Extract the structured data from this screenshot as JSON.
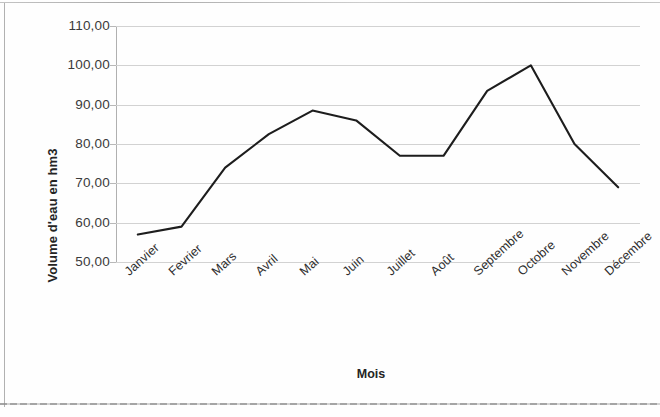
{
  "chart_data": {
    "type": "line",
    "title": "",
    "xlabel": "Mois",
    "ylabel": "Volume d'eau en hm3",
    "categories": [
      "Janvier",
      "Fevrier",
      "Mars",
      "Avril",
      "Mai",
      "Juin",
      "Juillet",
      "Août",
      "Septembre",
      "Octobre",
      "Novembre",
      "Décembre"
    ],
    "values": [
      57.0,
      59.0,
      74.0,
      82.5,
      88.5,
      86.0,
      77.0,
      77.0,
      93.5,
      100.0,
      80.0,
      69.0
    ],
    "series": [
      {
        "name": "Volume d'eau",
        "values": [
          57.0,
          59.0,
          74.0,
          82.5,
          88.5,
          86.0,
          77.0,
          77.0,
          93.5,
          100.0,
          80.0,
          69.0
        ]
      }
    ],
    "ylim": [
      50,
      110
    ],
    "ytick_step": 10,
    "ytick_labels": [
      "110,00",
      "100,00",
      "90,00",
      "80,00",
      "70,00",
      "60,00",
      "50,00"
    ],
    "ytick_values": [
      110,
      100,
      90,
      80,
      70,
      60,
      50
    ],
    "grid": true,
    "grid_axis": "y",
    "legend": false,
    "legend_position": "none",
    "marker": "none",
    "line_color": "#1d1d1d",
    "grid_color": "#d2d2d2",
    "axis_color": "#b0b0b0",
    "decimal_separator": ",",
    "xtick_rotation": -42
  },
  "axes": {
    "y_title": "Volume d'eau en hm3",
    "x_title": "Mois"
  },
  "ticks": {
    "y": [
      {
        "label": "110,00",
        "value": 110
      },
      {
        "label": "100,00",
        "value": 100
      },
      {
        "label": "90,00",
        "value": 90
      },
      {
        "label": "80,00",
        "value": 80
      },
      {
        "label": "70,00",
        "value": 70
      },
      {
        "label": "60,00",
        "value": 60
      },
      {
        "label": "50,00",
        "value": 50
      }
    ],
    "x": [
      {
        "label": "Janvier"
      },
      {
        "label": "Fevrier"
      },
      {
        "label": "Mars"
      },
      {
        "label": "Avril"
      },
      {
        "label": "Mai"
      },
      {
        "label": "Juin"
      },
      {
        "label": "Juillet"
      },
      {
        "label": "Août"
      },
      {
        "label": "Septembre"
      },
      {
        "label": "Octobre"
      },
      {
        "label": "Novembre"
      },
      {
        "label": "Décembre"
      }
    ]
  }
}
